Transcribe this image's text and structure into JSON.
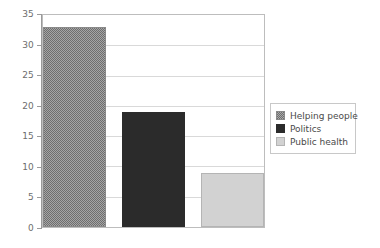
{
  "chart_data": {
    "type": "bar",
    "title": "",
    "xlabel": "",
    "ylabel": "",
    "categories": [
      "Helping people",
      "Politics",
      "Public health"
    ],
    "values": [
      33,
      19,
      9
    ],
    "ylim": [
      0,
      35
    ],
    "yticks": [
      0,
      5,
      10,
      15,
      20,
      25,
      30,
      35
    ],
    "ytick_labels": [
      "0",
      "5",
      "10",
      "15",
      "20",
      "25",
      "30",
      "35"
    ],
    "grid": true,
    "grid_axis": "y",
    "legend": {
      "position": "right",
      "entries": [
        {
          "label": "Helping people",
          "swatch": "dark-gray-hatched",
          "color": "#6e6e6e"
        },
        {
          "label": "Politics",
          "swatch": "near-black-solid",
          "color": "#2b2b2b"
        },
        {
          "label": "Public health",
          "swatch": "light-gray-solid",
          "color": "#d2d2d2"
        }
      ]
    },
    "colors": {
      "background": "#ffffff",
      "gridline": "#d9d9d9",
      "axis": "#9a9a9a",
      "plot_border": "#bdbdbd",
      "tick_text": "#6d6d6d",
      "legend_text": "#4a4a4a",
      "legend_border": "#c8c8c8"
    },
    "bars": [
      {
        "name": "Helping people",
        "value": 33,
        "class": "bar-helping",
        "left": 0,
        "width": 63
      },
      {
        "name": "Politics",
        "value": 19,
        "class": "bar-politics",
        "left": 79,
        "width": 63
      },
      {
        "name": "Public health",
        "value": 9,
        "class": "bar-public",
        "left": 158,
        "width": 63
      }
    ]
  }
}
